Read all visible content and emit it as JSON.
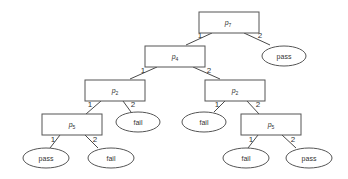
{
  "diagram": {
    "type": "binary decision tree",
    "nodes": [
      {
        "id": "n1",
        "kind": "test",
        "label": "p",
        "sub": "7"
      },
      {
        "id": "n2",
        "kind": "test",
        "label": "p",
        "sub": "4"
      },
      {
        "id": "n3",
        "kind": "result",
        "label": "pass"
      },
      {
        "id": "n4",
        "kind": "test",
        "label": "p",
        "sub": "2"
      },
      {
        "id": "n5",
        "kind": "test",
        "label": "p",
        "sub": "2"
      },
      {
        "id": "n6",
        "kind": "test",
        "label": "p",
        "sub": "5"
      },
      {
        "id": "n7",
        "kind": "result",
        "label": "fail"
      },
      {
        "id": "n8",
        "kind": "result",
        "label": "fail"
      },
      {
        "id": "n9",
        "kind": "test",
        "label": "p",
        "sub": "5"
      },
      {
        "id": "n10",
        "kind": "result",
        "label": "pass"
      },
      {
        "id": "n11",
        "kind": "result",
        "label": "fail"
      },
      {
        "id": "n12",
        "kind": "result",
        "label": "fail"
      },
      {
        "id": "n13",
        "kind": "result",
        "label": "pass"
      }
    ],
    "edges": [
      {
        "from": "n1",
        "to": "n2",
        "label": "1"
      },
      {
        "from": "n1",
        "to": "n3",
        "label": "2"
      },
      {
        "from": "n2",
        "to": "n4",
        "label": "1"
      },
      {
        "from": "n2",
        "to": "n5",
        "label": "2"
      },
      {
        "from": "n4",
        "to": "n6",
        "label": "1"
      },
      {
        "from": "n4",
        "to": "n7",
        "label": "2"
      },
      {
        "from": "n5",
        "to": "n8",
        "label": "1"
      },
      {
        "from": "n5",
        "to": "n9",
        "label": "2"
      },
      {
        "from": "n6",
        "to": "n10",
        "label": "1"
      },
      {
        "from": "n6",
        "to": "n11",
        "label": "2"
      },
      {
        "from": "n9",
        "to": "n12",
        "label": "1"
      },
      {
        "from": "n9",
        "to": "n13",
        "label": "2"
      }
    ]
  },
  "labels": {
    "n1": "p",
    "n1_sub": "7",
    "n2": "p",
    "n2_sub": "4",
    "n3": "pass",
    "n4": "p",
    "n4_sub": "2",
    "n5": "p",
    "n5_sub": "2",
    "n6": "p",
    "n6_sub": "5",
    "n7": "fail",
    "n8": "fail",
    "n9": "p",
    "n9_sub": "5",
    "n10": "pass",
    "n11": "fail",
    "n12": "fail",
    "n13": "pass",
    "e1": "1",
    "e2": "2"
  }
}
